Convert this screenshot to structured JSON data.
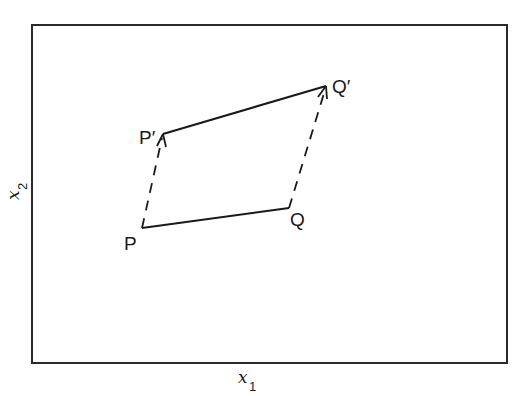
{
  "diagram": {
    "type": "vector-translation",
    "axes": {
      "x_label": "x",
      "x_subscript": "1",
      "y_label": "x",
      "y_subscript": "2"
    },
    "points": {
      "P": {
        "label": "P",
        "x": 142,
        "y": 228
      },
      "Q": {
        "label": "Q",
        "x": 289,
        "y": 208
      },
      "P_prime": {
        "label": "P′",
        "x": 163,
        "y": 134
      },
      "Q_prime": {
        "label": "Q′",
        "x": 326,
        "y": 86
      }
    },
    "segments": [
      {
        "from": "P",
        "to": "Q",
        "style": "solid"
      },
      {
        "from": "P_prime",
        "to": "Q_prime",
        "style": "solid"
      },
      {
        "from": "P",
        "to": "P_prime",
        "style": "dashed",
        "arrow": "end"
      },
      {
        "from": "Q",
        "to": "Q_prime",
        "style": "dashed",
        "arrow": "end"
      }
    ],
    "colors": {
      "line": "#1a1a1a",
      "frame": "#2a2a2a",
      "background": "#ffffff"
    }
  }
}
